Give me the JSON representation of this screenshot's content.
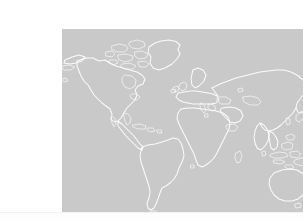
{
  "page": {
    "background_color": "#ffffff",
    "width": 303,
    "height": 219
  },
  "map": {
    "alt_text": "World map",
    "projection": "equirectangular",
    "ocean_color": "#c9c9c9",
    "coastline_color": "#fbfbfb",
    "land_fill": "none",
    "bounds": {
      "left": 22,
      "top": 13,
      "width": 261,
      "height": 192
    },
    "continents": [
      "North America",
      "South America",
      "Europe",
      "Africa",
      "Asia",
      "Australia",
      "Greenland"
    ],
    "features": [
      "Canadian Arctic Archipelago",
      "Greenland",
      "Alaska and Aleutian Islands",
      "Caribbean islands",
      "British Isles",
      "Scandinavia",
      "Mediterranean Sea",
      "Arabian Peninsula",
      "Indian subcontinent",
      "Japan",
      "Indonesia",
      "New Guinea",
      "New Zealand",
      "Madagascar"
    ],
    "labels": [],
    "gridlines": false,
    "legend": null
  },
  "bottom_rule": {
    "color": "#f2f2f2",
    "visible": true
  }
}
